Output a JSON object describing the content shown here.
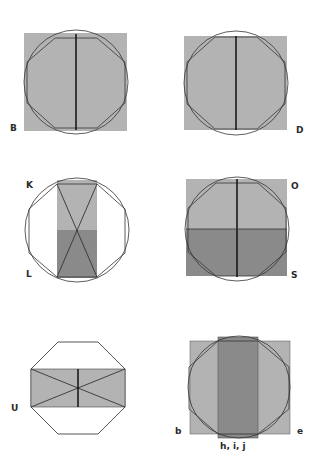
{
  "colors": {
    "light_gray": "#b3b3b3",
    "dark_gray": "#8a8a8a",
    "stroke": "#333333",
    "background": "#ffffff"
  },
  "panels": [
    {
      "id": "B",
      "labels": [
        "B"
      ],
      "description": "square with inscribed circle and octagon, vertical center line"
    },
    {
      "id": "D",
      "labels": [
        "D"
      ],
      "description": "square with inscribed circle and octagon, vertical center line"
    },
    {
      "id": "KL",
      "labels": [
        "K",
        "L"
      ],
      "description": "circle and octagon with vertical rectangle, light upper half, dark lower half, X diagonals"
    },
    {
      "id": "OS",
      "labels": [
        "O",
        "S"
      ],
      "description": "square with circle and octagon, light upper half, dark lower half, cross lines"
    },
    {
      "id": "U",
      "labels": [
        "U"
      ],
      "description": "octagon with horizontal rectangle and X diagonals, vertical center line"
    },
    {
      "id": "bhije",
      "labels": [
        "b",
        "h, i, j",
        "e"
      ],
      "description": "square with circle and octagon, dark vertical central rectangle"
    }
  ]
}
